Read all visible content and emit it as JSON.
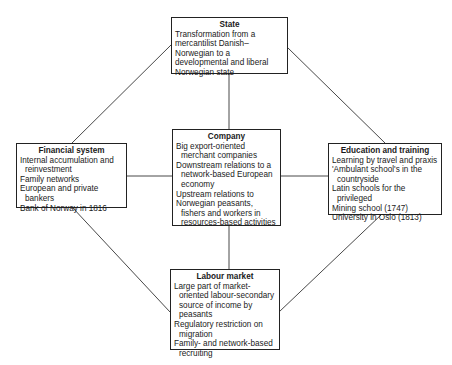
{
  "diagram": {
    "nodes": {
      "state": {
        "title": "State",
        "items": [
          "Transformation from a mercantilist Danish–Norwegian to a developmental and liberal Norwegian state"
        ]
      },
      "financial": {
        "title": "Financial system",
        "items": [
          "Internal accumulation and reinvestment",
          "Family networks",
          "European and private bankers",
          "Bank of Norway in 1816"
        ]
      },
      "company": {
        "title": "Company",
        "items": [
          "Big export-oriented merchant companies",
          "Downstream relations to a network-based European economy",
          "Upstream relations to",
          "Norwegian peasants, fishers and workers in resources-based activities"
        ]
      },
      "education": {
        "title": "Education and training",
        "items": [
          "Learning by travel and praxis",
          "'Ambulant school's in the countryside",
          "Latin schools for the privileged",
          "Mining school (1747)",
          "University in Oslo (1813)"
        ]
      },
      "labour": {
        "title": "Labour market",
        "items": [
          "Large part of market-oriented labour-secondary source of income by peasants",
          "Regulatory restriction on migration",
          "Family- and network-based recruiting"
        ]
      }
    },
    "edges": [
      [
        "state",
        "company"
      ],
      [
        "state",
        "financial"
      ],
      [
        "state",
        "education"
      ],
      [
        "financial",
        "company"
      ],
      [
        "company",
        "education"
      ],
      [
        "financial",
        "labour"
      ],
      [
        "education",
        "labour"
      ],
      [
        "company",
        "labour"
      ]
    ]
  }
}
